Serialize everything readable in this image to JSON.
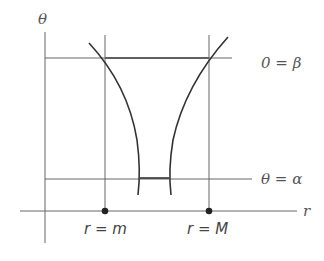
{
  "diagram": {
    "axes": {
      "vertical_label": "θ",
      "horizontal_label": "r"
    },
    "lines": {
      "top_label": "0 = β",
      "bottom_label": "θ = α"
    },
    "points": {
      "left_label": "r = m",
      "right_label": "r = M"
    },
    "colors": {
      "line": "#555555",
      "curve": "#333333",
      "point": "#222222"
    }
  }
}
